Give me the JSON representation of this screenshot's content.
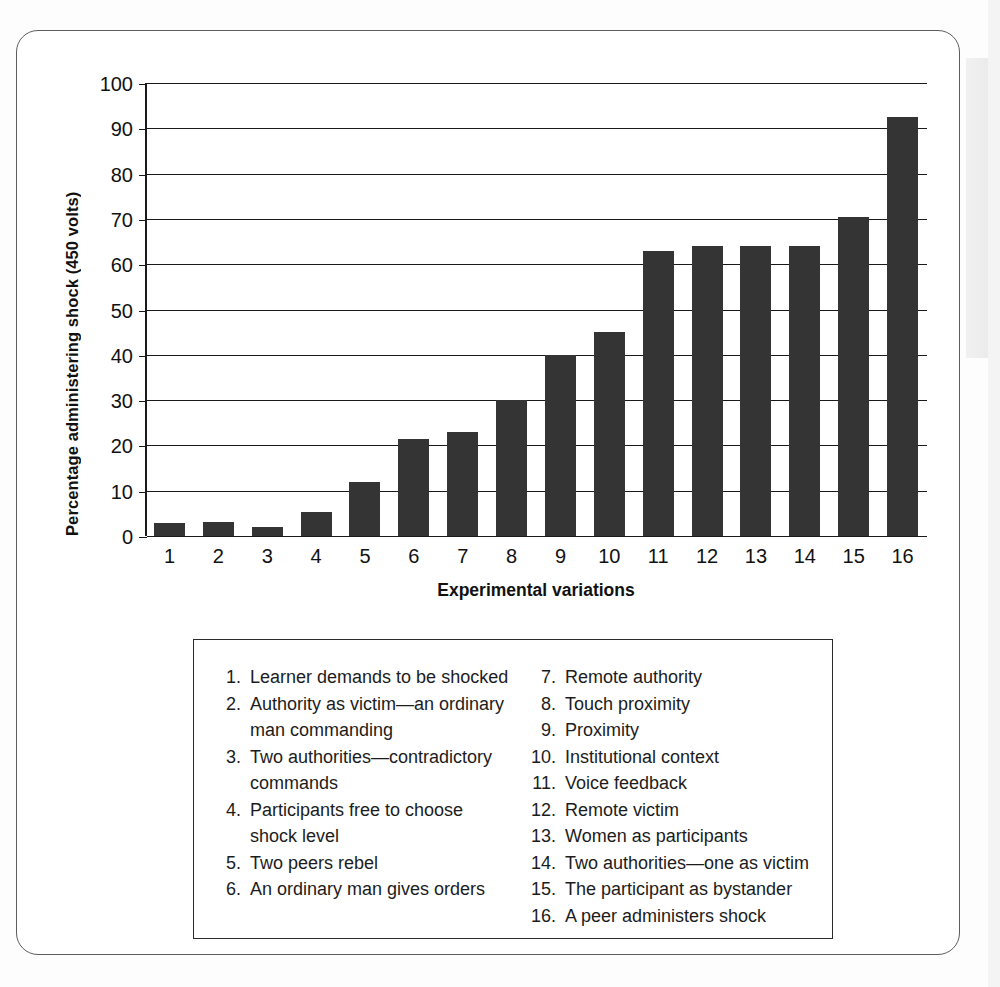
{
  "chart_data": {
    "type": "bar",
    "title": "",
    "xlabel": "Experimental variations",
    "ylabel": "Percentage administering shock (450 volts)",
    "categories": [
      "1",
      "2",
      "3",
      "4",
      "5",
      "6",
      "7",
      "8",
      "9",
      "10",
      "11",
      "12",
      "13",
      "14",
      "15",
      "16"
    ],
    "values": [
      2.8,
      3.2,
      2.0,
      5.3,
      12.0,
      21.5,
      23.0,
      30.0,
      40.0,
      45.0,
      63.0,
      64.0,
      64.0,
      64.0,
      70.5,
      92.5
    ],
    "ylim": [
      0,
      100
    ],
    "yticks": [
      0,
      10,
      20,
      30,
      40,
      50,
      60,
      70,
      80,
      90,
      100
    ],
    "grid": true,
    "legend_position": "below-plot",
    "bar_color": "#343434"
  },
  "axis": {
    "y_title": "Percentage administering shock (450 volts)",
    "x_title": "Experimental variations",
    "y_tick_labels": [
      "100",
      "90",
      "80",
      "70",
      "60",
      "50",
      "40",
      "30",
      "20",
      "10",
      "0"
    ],
    "x_tick_labels": [
      "1",
      "2",
      "3",
      "4",
      "5",
      "6",
      "7",
      "8",
      "9",
      "10",
      "11",
      "12",
      "13",
      "14",
      "15",
      "16"
    ]
  },
  "legend": {
    "left_column": [
      {
        "num": "1.",
        "text": "Learner demands to be shocked"
      },
      {
        "num": "2.",
        "text": "Authority as victim—an ordinary man commanding"
      },
      {
        "num": "3.",
        "text": "Two authorities—contradictory commands"
      },
      {
        "num": "4.",
        "text": "Participants free to choose shock level"
      },
      {
        "num": "5.",
        "text": "Two peers rebel"
      },
      {
        "num": "6.",
        "text": "An ordinary man gives orders"
      }
    ],
    "right_column": [
      {
        "num": "7.",
        "text": "Remote authority"
      },
      {
        "num": "8.",
        "text": "Touch proximity"
      },
      {
        "num": "9.",
        "text": "Proximity"
      },
      {
        "num": "10.",
        "text": "Institutional context"
      },
      {
        "num": "11.",
        "text": "Voice feedback"
      },
      {
        "num": "12.",
        "text": "Remote victim"
      },
      {
        "num": "13.",
        "text": "Women as participants"
      },
      {
        "num": "14.",
        "text": "Two authorities—one as victim"
      },
      {
        "num": "15.",
        "text": "The participant as bystander"
      },
      {
        "num": "16.",
        "text": "A peer administers shock"
      }
    ]
  }
}
